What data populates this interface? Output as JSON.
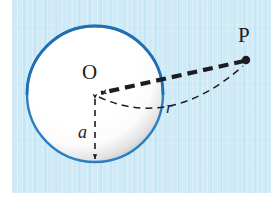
{
  "figure": {
    "background_color": "#cfeaf7",
    "plate": {
      "x": 12,
      "y": 0,
      "width": 259,
      "height": 193
    }
  },
  "labels": {
    "center": "O",
    "point": "P",
    "radius_sphere": "a",
    "distance": "r"
  },
  "geometry": {
    "sphere": {
      "center_x": 95,
      "center_y": 94,
      "radius": 68,
      "outline_color": "#2a7fc1",
      "fill_color": "#ffffff",
      "shadow_color": "#9a9a9a"
    },
    "point_p": {
      "x": 246,
      "y": 60,
      "color": "#1c1c22",
      "dot_radius": 4
    },
    "segment_op": {
      "style": "thick-dashed",
      "color": "#1c1c22",
      "from_x": 95,
      "from_y": 94,
      "to_x": 246,
      "to_y": 60,
      "arrowhead_at": "O"
    },
    "segment_oa": {
      "style": "dashed",
      "color": "#1c1c22",
      "from_x": 95,
      "from_y": 94,
      "to_x": 95,
      "to_y": 163,
      "arrowheads": "both"
    },
    "arc_r": {
      "style": "dashed",
      "color": "#1c1c22",
      "from_x": 95,
      "from_y": 94,
      "to_x": 245,
      "to_y": 64,
      "control_x": 170,
      "control_y": 128
    }
  }
}
